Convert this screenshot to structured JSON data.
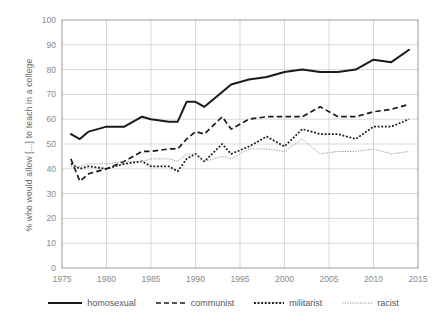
{
  "chart_data": {
    "type": "line",
    "title": "",
    "subtitle": "",
    "xlabel": "",
    "ylabel": "% who would allow [...] to teach in a college",
    "xlim": [
      1975,
      2015
    ],
    "ylim": [
      0,
      100
    ],
    "xticks": [
      "1975",
      "1980",
      "1985",
      "1990",
      "1995",
      "2000",
      "2005",
      "2010",
      "2015"
    ],
    "yticks": [
      "0",
      "10",
      "20",
      "30",
      "40",
      "50",
      "60",
      "70",
      "80",
      "90",
      "100"
    ],
    "grid": "both",
    "legend_position": "bottom",
    "x": [
      1976,
      1977,
      1978,
      1980,
      1982,
      1984,
      1985,
      1987,
      1988,
      1989,
      1990,
      1991,
      1993,
      1994,
      1996,
      1998,
      2000,
      2002,
      2004,
      2006,
      2008,
      2010,
      2012,
      2014
    ],
    "series": [
      {
        "name": "homosexual",
        "style": "solid",
        "color": "#1a1a1a",
        "values": [
          54,
          52,
          55,
          57,
          57,
          61,
          60,
          59,
          59,
          67,
          67,
          65,
          71,
          74,
          76,
          77,
          79,
          80,
          79,
          79,
          80,
          84,
          83,
          88
        ]
      },
      {
        "name": "communist",
        "style": "dashed",
        "color": "#1a1a1a",
        "values": [
          44,
          35,
          38,
          40,
          43,
          47,
          47,
          48,
          48,
          52,
          55,
          54,
          61,
          56,
          60,
          61,
          61,
          61,
          65,
          61,
          61,
          63,
          64,
          66
        ]
      },
      {
        "name": "militarist",
        "style": "dotted",
        "color": "#1a1a1a",
        "values": [
          42,
          40,
          41,
          40,
          42,
          43,
          41,
          41,
          39,
          44,
          46,
          43,
          50,
          46,
          49,
          53,
          49,
          56,
          54,
          54,
          52,
          57,
          57,
          60
        ]
      },
      {
        "name": "racist",
        "style": "fine-dotted",
        "color": "#9a9a9a",
        "values": [
          41,
          41,
          42,
          42,
          43,
          43,
          44,
          44,
          43,
          46,
          46,
          43,
          45,
          44,
          48,
          48,
          47,
          52,
          46,
          47,
          47,
          48,
          46,
          47
        ]
      }
    ]
  },
  "legend": {
    "items": [
      {
        "label": "homosexual"
      },
      {
        "label": "communist"
      },
      {
        "label": "militarist"
      },
      {
        "label": "racist"
      }
    ]
  }
}
